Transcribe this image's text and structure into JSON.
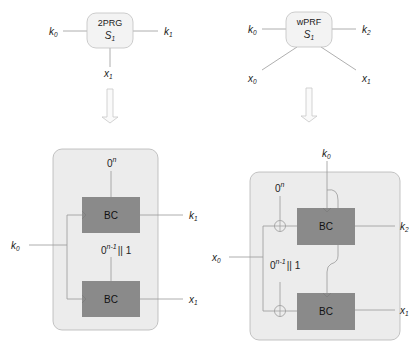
{
  "left": {
    "top_box": {
      "line1": "2PRG",
      "line2": "S",
      "line2_sub": "1"
    },
    "inputs": {
      "k0": "k",
      "k0_sub": "0",
      "k1": "k",
      "k1_sub": "1",
      "x1": "x",
      "x1_sub": "1"
    },
    "panel": {
      "block_label": "BC",
      "const_top": "0",
      "const_top_sup": "n",
      "const_mid": "0",
      "const_mid_sup": "n-1",
      "const_mid_tail": "|| 1",
      "k0": "k",
      "k0_sub": "0",
      "k1": "k",
      "k1_sub": "1",
      "x1": "x",
      "x1_sub": "1"
    }
  },
  "right": {
    "top_box": {
      "line1": "wPRF",
      "line2": "S",
      "line2_sub": "1"
    },
    "inputs": {
      "k0": "k",
      "k0_sub": "0",
      "k2": "k",
      "k2_sub": "2",
      "x0": "x",
      "x0_sub": "0",
      "x1": "x",
      "x1_sub": "1"
    },
    "panel": {
      "block_label": "BC",
      "const_top": "0",
      "const_top_sup": "n",
      "const_mid": "0",
      "const_mid_sup": "n-1",
      "const_mid_tail": "|| 1",
      "k0": "k",
      "k0_sub": "0",
      "k2": "k",
      "k2_sub": "2",
      "x0": "x",
      "x0_sub": "0",
      "x1": "x",
      "x1_sub": "1"
    }
  },
  "colors": {
    "panel_fill": "#ececec",
    "panel_stroke": "#b5b5b5",
    "bc_fill": "#8a8a8a",
    "line": "#9a9a9a",
    "arrow": "#c8c8c8"
  }
}
